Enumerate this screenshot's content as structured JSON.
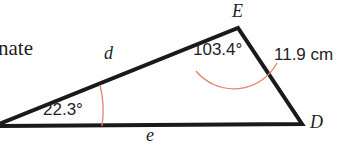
{
  "figure": {
    "type": "triangle-diagram",
    "background_color": "#ffffff",
    "stroke_color": "#1a1a1a",
    "arc_color": "#e0846b",
    "text_color": "#221f1f"
  },
  "surrounding_text": {
    "cropped_word": "nate"
  },
  "triangle": {
    "vertices": [
      {
        "name": "E",
        "label": "E",
        "x": 238,
        "y": 28
      },
      {
        "name": "D",
        "label": "D",
        "x": 302,
        "y": 124
      },
      {
        "name": "left",
        "label": "",
        "x": -4,
        "y": 126
      }
    ],
    "sides": [
      {
        "name": "d",
        "label": "d",
        "from": "left",
        "to": "E"
      },
      {
        "name": "e",
        "label": "e",
        "from": "left",
        "to": "D"
      },
      {
        "name": "ED",
        "label": "11.9 cm",
        "from": "E",
        "to": "D"
      }
    ],
    "angles": [
      {
        "at": "E",
        "label": "103.4°",
        "value": 103.4
      },
      {
        "at": "left",
        "label": "22.3°",
        "value": 22.3
      }
    ]
  }
}
